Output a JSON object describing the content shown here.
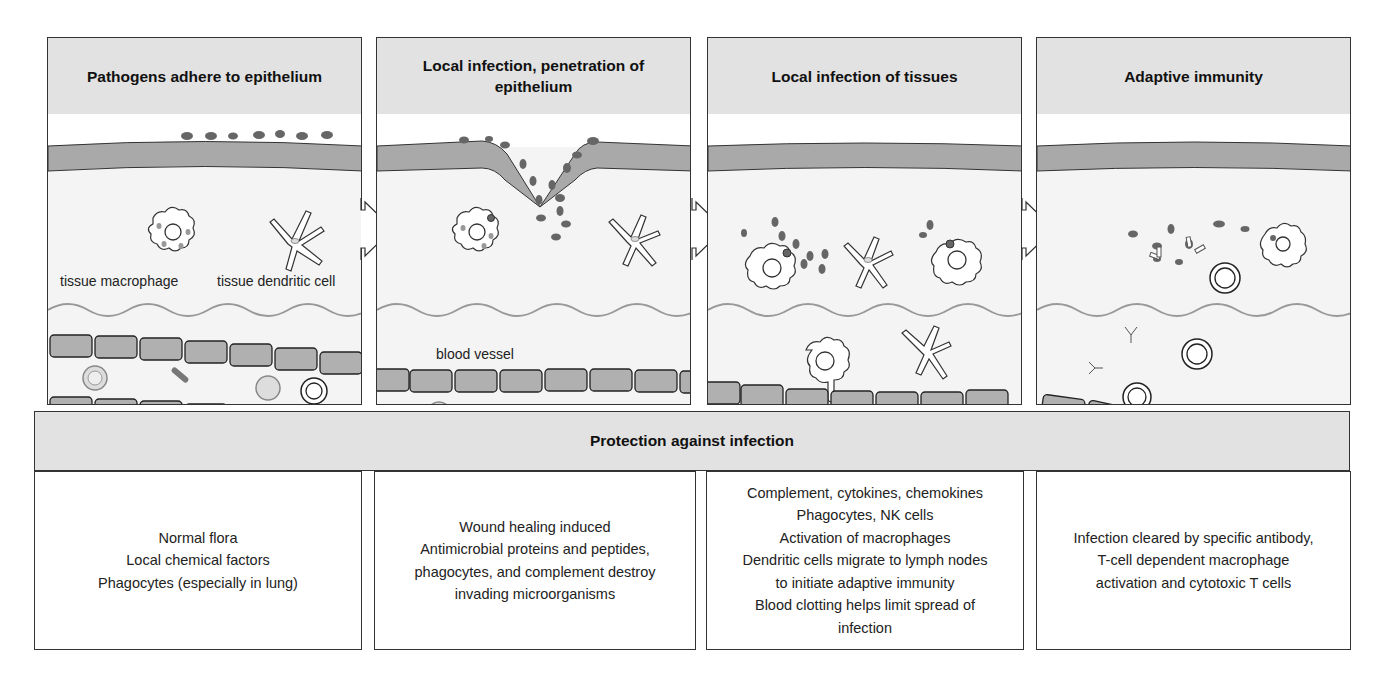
{
  "panels": [
    {
      "title": "Pathogens adhere to epithelium",
      "labels": {
        "macrophage": "tissue macrophage",
        "dendritic": "tissue dendritic cell"
      }
    },
    {
      "title": "Local infection, penetration of epithelium",
      "labels": {
        "vessel": "blood vessel"
      }
    },
    {
      "title": "Local infection of tissues"
    },
    {
      "title": "Adaptive immunity"
    }
  ],
  "protection": {
    "title": "Protection against infection",
    "boxes": [
      {
        "lines": [
          "Normal flora",
          "Local chemical factors",
          "Phagocytes (especially in lung)"
        ]
      },
      {
        "lines": [
          "Wound healing induced",
          "Antimicrobial proteins and peptides,",
          "phagocytes, and complement destroy",
          "invading microorganisms"
        ]
      },
      {
        "lines": [
          "Complement, cytokines, chemokines",
          "Phagocytes, NK cells",
          "Activation of macrophages",
          "Dendritic cells migrate to lymph nodes",
          "to initiate adaptive immunity",
          "Blood clotting helps limit spread of",
          "infection"
        ]
      },
      {
        "lines": [
          "Infection cleared by specific antibody,",
          "T-cell dependent macrophage",
          "activation and cytotoxic T cells"
        ]
      }
    ]
  },
  "colors": {
    "header_bg": "#e2e2e2",
    "epithelium": "#a9a9a9",
    "pathogen": "#6a6a6a",
    "endothelial": "#b0b0b0",
    "tissue_bg": "#f4f4f4",
    "border": "#333333"
  }
}
